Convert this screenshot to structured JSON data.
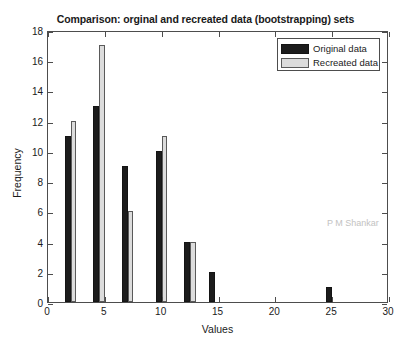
{
  "chart_data": {
    "type": "bar",
    "title": "Comparison: orginal and recreated data (bootstrapping) sets",
    "xlabel": "Values",
    "ylabel": "Frequency",
    "xlim": [
      0,
      30
    ],
    "ylim": [
      0,
      18
    ],
    "xticks": [
      0,
      5,
      10,
      15,
      20,
      25,
      30
    ],
    "yticks": [
      0,
      2,
      4,
      6,
      8,
      10,
      12,
      14,
      16,
      18
    ],
    "grid": false,
    "legend_position": "top-right",
    "bar_width": 1.0,
    "x": [
      2.0,
      4.5,
      7.0,
      10.0,
      12.5,
      14.7,
      25.0
    ],
    "series": [
      {
        "name": "Original data",
        "color": "#1c1c1c",
        "values": [
          11,
          13,
          9,
          10,
          4,
          2,
          1
        ]
      },
      {
        "name": "Recreated data",
        "color": "#dcdcdc",
        "values": [
          12,
          17,
          6,
          11,
          4,
          0,
          0
        ]
      }
    ],
    "annotations": [
      {
        "text": "P M Shankar",
        "color": "#c2c2c2"
      }
    ]
  },
  "legend": {
    "entries": [
      {
        "label": "Original data"
      },
      {
        "label": "Recreated data"
      }
    ]
  },
  "watermark": {
    "text": "P M Shankar"
  }
}
